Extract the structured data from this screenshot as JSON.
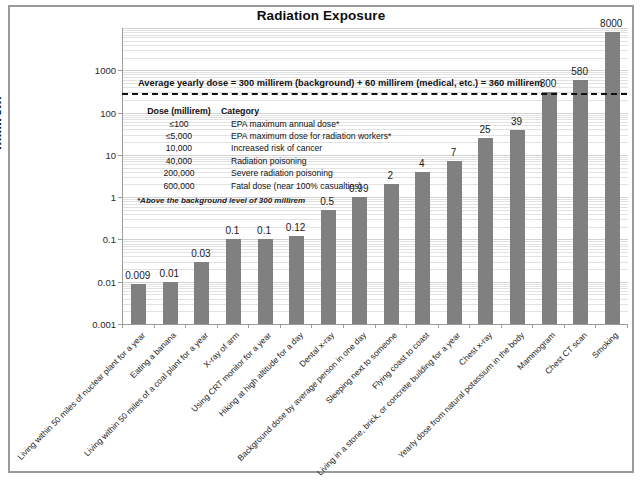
{
  "chart_data": {
    "type": "bar",
    "title": "Radiation Exposure",
    "xlabel": "",
    "ylabel": "millirem",
    "yscale": "log",
    "ylim": [
      0.001,
      10000
    ],
    "ytick_labels": [
      "1000",
      "100",
      "10",
      "1",
      "0.1",
      "0.01",
      "0.001"
    ],
    "ytick_values": [
      1000,
      100,
      10,
      1,
      0.1,
      0.01,
      0.001
    ],
    "grid": true,
    "legend": "none",
    "categories": [
      "Living within 50 miles of nuclear plant for a year",
      "Eating a banana",
      "Living within 50 miles of a coal plant for a year",
      "X-ray of arm",
      "Using CRT monitor for a year",
      "Hiking at high altitude for a day",
      "Dental x-ray",
      "Background dose by average person in one day",
      "Sleeping next to someone",
      "Flying coast to coast",
      "Living in a stone, brick, or concrete building for a year",
      "Chest x-ray",
      "Yearly dose from natural potassium in the body",
      "Mammogram",
      "Chest CT scan",
      "Smoking"
    ],
    "values": [
      0.009,
      0.01,
      0.03,
      0.1,
      0.1,
      0.12,
      0.5,
      0.99,
      2,
      4,
      7,
      25,
      39,
      300,
      580,
      8000
    ],
    "value_labels": [
      "0.009",
      "0.01",
      "0.03",
      "0.1",
      "0.1",
      "0.12",
      "0.5",
      "0.99",
      "2",
      "4",
      "7",
      "25",
      "39",
      "300",
      "580",
      "8000"
    ],
    "bar_color": "#808080",
    "annotations": [
      {
        "name": "average-yearly-dose",
        "text": "Average  yearly dose = 300 millirem (background) + 60 millirem (medical, etc.) = 360 millirem",
        "value": 360,
        "style": "dashed-horizontal-line"
      }
    ]
  },
  "dose_table": {
    "headers": [
      "Dose (millirem)",
      "Category"
    ],
    "rows": [
      {
        "dose": "≤100",
        "category": "EPA maximum annual dose*"
      },
      {
        "dose": "≤5,000",
        "category": "EPA maximum dose for radiation workers*"
      },
      {
        "dose": "10,000",
        "category": "Increased risk of cancer"
      },
      {
        "dose": "40,000",
        "category": "Radiation poisoning"
      },
      {
        "dose": "200,000",
        "category": "Severe radiation poisoning"
      },
      {
        "dose": "600,000",
        "category": "Fatal dose (near 100% casualties)"
      }
    ],
    "footnote": "*Above the background level of 300 millirem"
  }
}
